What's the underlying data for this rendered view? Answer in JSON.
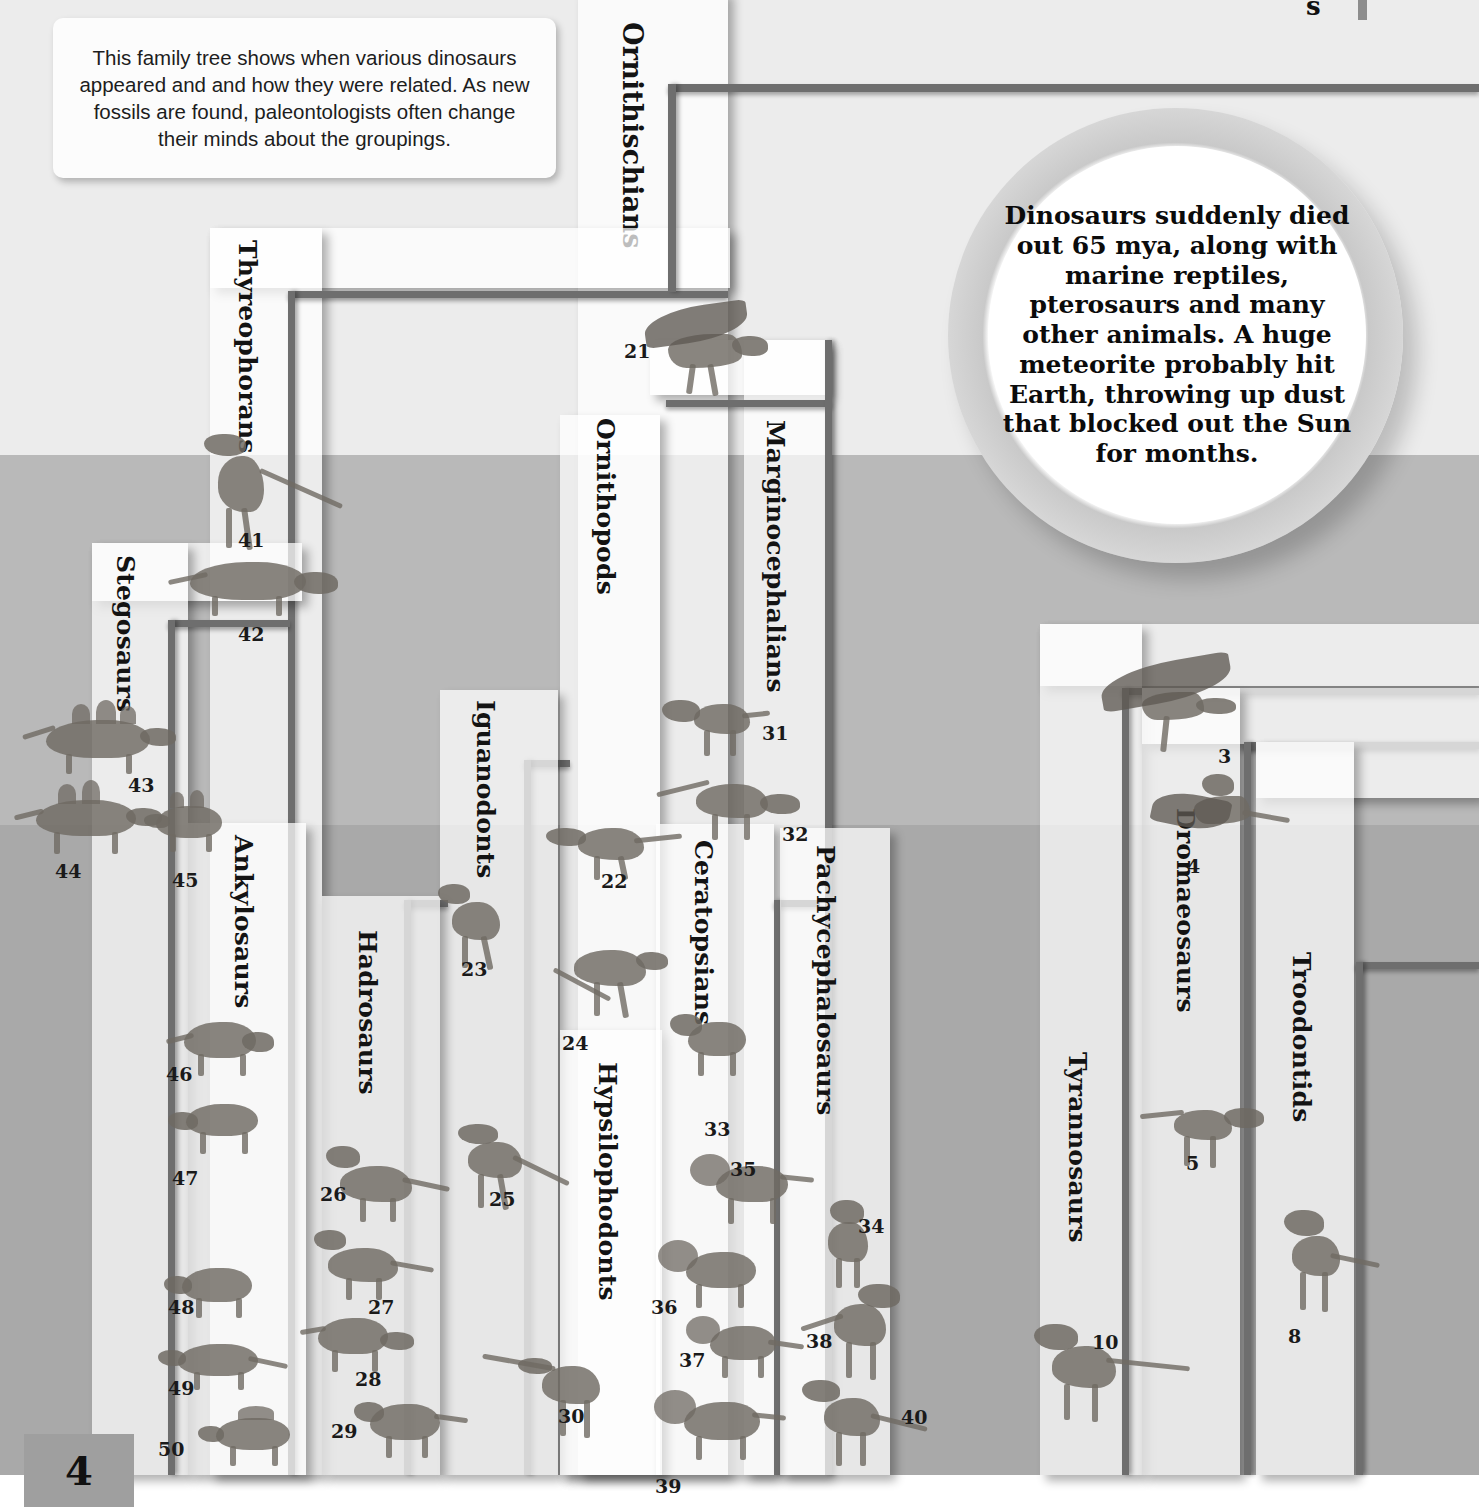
{
  "page": {
    "number": "4",
    "clipped_top_right_text": "s"
  },
  "caption": {
    "text": "This family tree shows when various dinosaurs appeared and and how they were related. As new fossils are found, paleontologists often change their minds about the groupings."
  },
  "extinction_callout": {
    "text": "Dinosaurs suddenly died out 65 mya, along with marine reptiles, pterosaurs and many other animals. A huge meteorite probably hit Earth, throwing up dust that blocked out the Sun for months."
  },
  "clades": [
    {
      "id": "ornithischians",
      "label": "Ornithischians"
    },
    {
      "id": "thyreophorans",
      "label": "Thyreophorans"
    },
    {
      "id": "stegosaurs",
      "label": "Stegosaurs"
    },
    {
      "id": "ankylosaurs",
      "label": "Ankylosaurs"
    },
    {
      "id": "ornithopods",
      "label": "Ornithopods"
    },
    {
      "id": "iguanodonts",
      "label": "Iguanodonts"
    },
    {
      "id": "hadrosaurs",
      "label": "Hadrosaurs"
    },
    {
      "id": "hypsilophodonts",
      "label": "Hypsilophodonts"
    },
    {
      "id": "marginocephalians",
      "label": "Marginocephalians"
    },
    {
      "id": "ceratopsians",
      "label": "Ceratopsians"
    },
    {
      "id": "pachycephalosaurs",
      "label": "Pachycephalosaurs"
    },
    {
      "id": "tyrannosaurs",
      "label": "Tyrannosaurs"
    },
    {
      "id": "dromaeosaurs",
      "label": "Dromaeosaurs"
    },
    {
      "id": "troodontids",
      "label": "Troodontids"
    }
  ],
  "specimens": [
    {
      "n": "3",
      "clade": "dromaeosaurs"
    },
    {
      "n": "4",
      "clade": "dromaeosaurs"
    },
    {
      "n": "5",
      "clade": "dromaeosaurs"
    },
    {
      "n": "8",
      "clade": "troodontids"
    },
    {
      "n": "10",
      "clade": "tyrannosaurs"
    },
    {
      "n": "21",
      "clade": "ornithischians"
    },
    {
      "n": "22",
      "clade": "ornithopods"
    },
    {
      "n": "23",
      "clade": "iguanodonts"
    },
    {
      "n": "24",
      "clade": "ornithopods"
    },
    {
      "n": "25",
      "clade": "iguanodonts"
    },
    {
      "n": "26",
      "clade": "hadrosaurs"
    },
    {
      "n": "27",
      "clade": "hadrosaurs"
    },
    {
      "n": "28",
      "clade": "hadrosaurs"
    },
    {
      "n": "29",
      "clade": "hadrosaurs"
    },
    {
      "n": "30",
      "clade": "hypsilophodonts"
    },
    {
      "n": "31",
      "clade": "marginocephalians"
    },
    {
      "n": "32",
      "clade": "marginocephalians"
    },
    {
      "n": "33",
      "clade": "ceratopsians"
    },
    {
      "n": "34",
      "clade": "pachycephalosaurs"
    },
    {
      "n": "35",
      "clade": "ceratopsians"
    },
    {
      "n": "36",
      "clade": "ceratopsians"
    },
    {
      "n": "37",
      "clade": "ceratopsians"
    },
    {
      "n": "38",
      "clade": "pachycephalosaurs"
    },
    {
      "n": "39",
      "clade": "ceratopsians"
    },
    {
      "n": "40",
      "clade": "pachycephalosaurs"
    },
    {
      "n": "41",
      "clade": "thyreophorans"
    },
    {
      "n": "42",
      "clade": "thyreophorans"
    },
    {
      "n": "43",
      "clade": "stegosaurs"
    },
    {
      "n": "44",
      "clade": "stegosaurs"
    },
    {
      "n": "45",
      "clade": "stegosaurs"
    },
    {
      "n": "46",
      "clade": "ankylosaurs"
    },
    {
      "n": "47",
      "clade": "ankylosaurs"
    },
    {
      "n": "48",
      "clade": "ankylosaurs"
    },
    {
      "n": "49",
      "clade": "ankylosaurs"
    },
    {
      "n": "50",
      "clade": "ankylosaurs"
    }
  ],
  "colors": {
    "band_top": "#ececec",
    "band_middle": "#b9b9b9",
    "band_bottom": "#a9a9a9",
    "clade_band": "#f4f4f4",
    "rule": "#6e6e6e",
    "page_plaque": "#9f9f9f"
  }
}
